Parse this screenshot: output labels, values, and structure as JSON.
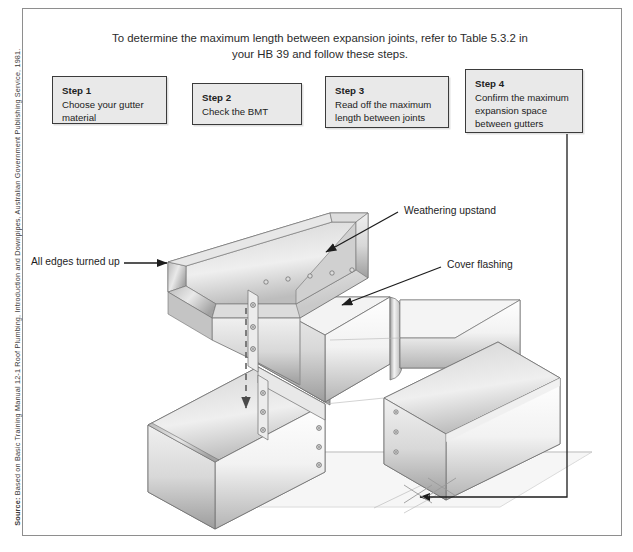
{
  "figure": {
    "intro_text": "To determine the maximum length between expansion joints, refer to Table 5.3.2 in your HB 39 and follow these steps.",
    "source_label": "Source:",
    "source_text": " Based on Basic Training Manual 12-1 Roof Plumbing, Introduction and Downpipes, Australian Government Publishing Service, 1981."
  },
  "steps": [
    {
      "title": "Step 1",
      "body": "Choose your gutter material"
    },
    {
      "title": "Step 2",
      "body": "Check the BMT"
    },
    {
      "title": "Step 3",
      "body": "Read off the maximum length between joints"
    },
    {
      "title": "Step 4",
      "body": "Confirm the maximum expansion space between gutters"
    }
  ],
  "labels": {
    "weathering_upstand": "Weathering upstand",
    "cover_flashing": "Cover flashing",
    "all_edges_turned_up": "All edges turned up"
  },
  "colors": {
    "frame_border": "#8e8e8e",
    "step_fill": "#e9e9e9",
    "step_border": "#3b3b3b",
    "leader_line": "#1d1d1d",
    "metal_light": "#fdfdfd",
    "metal_mid": "#d6d6d6",
    "metal_dark": "#9a9a9a",
    "outline": "#6f6f6f",
    "ground_shadow": "#d9d9d9"
  }
}
